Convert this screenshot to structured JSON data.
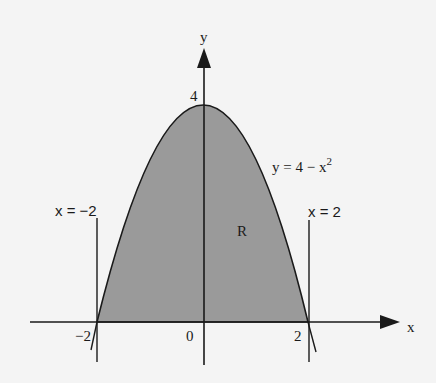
{
  "diagram": {
    "axes": {
      "x_label": "x",
      "y_label": "y"
    },
    "ticks": {
      "x_neg2": "−2",
      "x_0": "0",
      "x_2": "2",
      "y_4": "4"
    },
    "curve": {
      "label_main": "y = 4 − x",
      "label_exp": "2"
    },
    "lines": {
      "left": "x = −2",
      "right": "x = 2"
    },
    "region_label": "R",
    "colors": {
      "fill": "#9a9a9a",
      "stroke": "#1a1a1a",
      "background": "#f4f4f4"
    }
  }
}
